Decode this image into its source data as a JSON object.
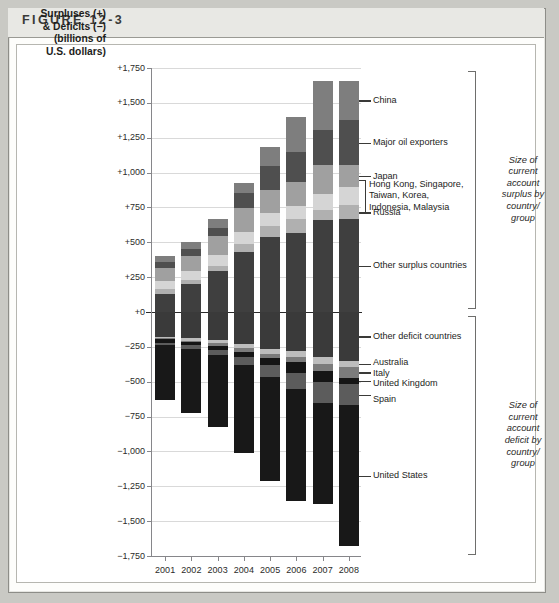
{
  "figure": {
    "label": "FIGURE 12-3"
  },
  "axis": {
    "title_lines": [
      "Surpluses (+)",
      "& Deficits (−)",
      "(billions of",
      "U.S. dollars)"
    ],
    "y_ticks": [
      "+1,750",
      "+1,500",
      "+1,250",
      "+1,000",
      "+750",
      "+500",
      "+250",
      "+0",
      "−250",
      "−500",
      "−750",
      "−1,000",
      "−1,250",
      "−1,500",
      "−1,750"
    ],
    "x_ticks": [
      "2001",
      "2002",
      "2003",
      "2004",
      "2005",
      "2006",
      "2007",
      "2008"
    ]
  },
  "annotations": {
    "china": "China",
    "oil": "Major oil exporters",
    "japan": "Japan",
    "asia_l1": "Hong Kong, Singapore,",
    "asia_l2": "Taiwan, Korea,",
    "asia_l3": "Indonesia, Malaysia",
    "russia": "Russia",
    "other_surplus": "Other surplus countries",
    "other_deficit": "Other deficit countries",
    "australia": "Australia",
    "italy": "Italy",
    "uk": "United Kingdom",
    "spain": "Spain",
    "usa": "United States",
    "group_surplus": "Size of current account surplus by country/ group",
    "group_deficit": "Size of current account deficit by country/ group"
  },
  "colors": {
    "china": "#7e7e7e",
    "oil": "#4f4f4f",
    "japan": "#a0a0a0",
    "asia": "#d5d5d5",
    "russia": "#b0b0b0",
    "other_surplus": "#3f3f3f",
    "other_deficit": "#3a3a3a",
    "australia": "#bdbdbd",
    "italy": "#7b7b7b",
    "uk": "#151515",
    "spain": "#5c5c5c",
    "usa": "#181818",
    "gridline": "#d9d9d9",
    "zeroline": "#2a2a2a",
    "axis": "#86868a"
  },
  "chart_data": {
    "type": "bar",
    "subtype": "stacked-diverging",
    "title": "Surpluses (+) & Deficits (−) (billions of U.S. dollars)",
    "xlabel": "",
    "ylabel": "Surpluses (+) & Deficits (−) (billions of U.S. dollars)",
    "ylim": [
      -1750,
      1750
    ],
    "ytick_step": 250,
    "grid": true,
    "legend": "leader-line annotations at right",
    "categories": [
      "2001",
      "2002",
      "2003",
      "2004",
      "2005",
      "2006",
      "2007",
      "2008"
    ],
    "series": [
      {
        "name": "Other surplus countries",
        "color": "#3f3f3f",
        "values": [
          130,
          200,
          295,
          430,
          535,
          570,
          660,
          665
        ]
      },
      {
        "name": "Russia",
        "color": "#b0b0b0",
        "values": [
          35,
          30,
          35,
          60,
          85,
          95,
          75,
          100
        ]
      },
      {
        "name": "Hong Kong, Singapore, Taiwan, Korea, Indonesia, Malaysia",
        "color": "#d5d5d5",
        "values": [
          60,
          65,
          80,
          85,
          90,
          95,
          110,
          130
        ]
      },
      {
        "name": "Japan",
        "color": "#a0a0a0",
        "values": [
          90,
          110,
          135,
          170,
          165,
          170,
          210,
          160
        ]
      },
      {
        "name": "Major oil exporters",
        "color": "#4f4f4f",
        "values": [
          45,
          45,
          55,
          110,
          170,
          215,
          250,
          320
        ]
      },
      {
        "name": "China",
        "color": "#7e7e7e",
        "values": [
          45,
          50,
          70,
          70,
          135,
          250,
          355,
          285
        ]
      }
    ],
    "totals_surplus": [
      405,
      500,
      670,
      925,
      1180,
      1395,
      1660,
      1660
    ],
    "deficit_series": [
      {
        "name": "Other deficit countries",
        "color": "#3a3a3a",
        "values": [
          -180,
          -190,
          -200,
          -230,
          -265,
          -280,
          -320,
          -350
        ]
      },
      {
        "name": "Australia",
        "color": "#bdbdbd",
        "values": [
          -10,
          -15,
          -25,
          -30,
          -35,
          -40,
          -55,
          -45
        ]
      },
      {
        "name": "Italy",
        "color": "#7b7b7b",
        "values": [
          -5,
          -10,
          -20,
          -25,
          -30,
          -40,
          -50,
          -75
        ]
      },
      {
        "name": "United Kingdom",
        "color": "#151515",
        "values": [
          -25,
          -25,
          -30,
          -40,
          -50,
          -80,
          -80,
          -45
        ]
      },
      {
        "name": "Spain",
        "color": "#5c5c5c",
        "values": [
          -20,
          -25,
          -30,
          -55,
          -85,
          -110,
          -145,
          -155
        ]
      },
      {
        "name": "United States",
        "color": "#181818",
        "values": [
          -390,
          -460,
          -520,
          -630,
          -745,
          -805,
          -730,
          -1010
        ]
      }
    ],
    "totals_deficit": [
      -630,
      -725,
      -825,
      -1010,
      -1210,
      -1355,
      -1380,
      -1680
    ]
  }
}
